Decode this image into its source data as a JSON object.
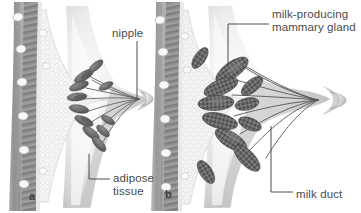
{
  "figure": {
    "background_color": "#ffffff",
    "label_color": "#4a4a4a",
    "leader_line_color": "#4d4d4d"
  },
  "panels": [
    {
      "id": "a",
      "id_label": "a",
      "name": "non-lactating-breast",
      "labels": [
        {
          "key": "nipple",
          "text": "nipple"
        },
        {
          "key": "adipose",
          "text": "adipose\ntissue",
          "line1": "adipose",
          "line2": "tissue"
        }
      ]
    },
    {
      "id": "b",
      "id_label": "b",
      "name": "lactating-breast",
      "labels": [
        {
          "key": "gland",
          "text": "milk-producing mammary gland",
          "line1": "milk-producing",
          "line2": "mammary gland"
        },
        {
          "key": "duct",
          "text": "milk duct"
        }
      ]
    }
  ],
  "labels": {
    "nipple": "nipple",
    "gland_line1": "milk-producing",
    "gland_line2": "mammary gland",
    "adipose_line1": "adipose",
    "adipose_line2": "tissue",
    "milk_duct": "milk duct",
    "panel_a": "a",
    "panel_b": "b"
  },
  "anatomy": {
    "structures": [
      "chest wall",
      "pectoral muscle",
      "rib",
      "adipose tissue",
      "mammary lobule",
      "milk duct",
      "nipple",
      "areola",
      "skin"
    ],
    "colors": {
      "skin_light": "#ececec",
      "skin_shadow": "#b9b9b9",
      "fat_fill": "#f2f2f2",
      "fat_cell_outline": "#cfcfcf",
      "muscle_dark": "#8e8e8e",
      "muscle_darker": "#6f6f6f",
      "rib_fill": "#f7f7f7",
      "lobule_dark": "#6b6b6b",
      "lobule_darkest": "#4f4f4f",
      "duct_line": "#5a5a5a"
    }
  }
}
